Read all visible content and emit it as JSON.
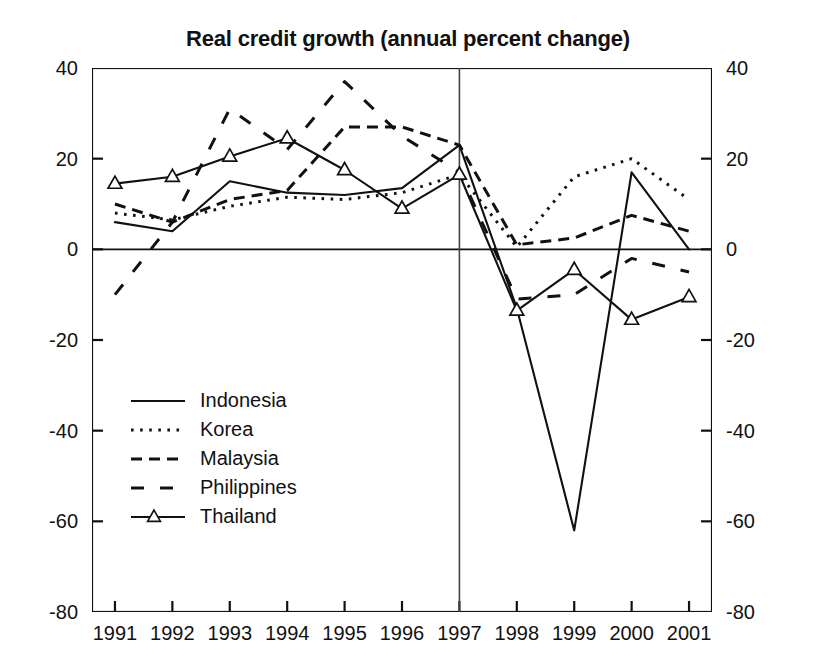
{
  "chart_data": {
    "type": "line",
    "title": "Real credit growth (annual percent change)",
    "xlabel": "",
    "ylabel": "",
    "x": [
      1991,
      1992,
      1993,
      1994,
      1995,
      1996,
      1997,
      1998,
      1999,
      2000,
      2001
    ],
    "xticklabels": [
      "1991",
      "1992",
      "1993",
      "1994",
      "1995",
      "1996",
      "1997",
      "1998",
      "1999",
      "2000",
      "2001"
    ],
    "yticks": [
      40,
      20,
      0,
      -20,
      -40,
      -60,
      -80
    ],
    "yticklabels_left": [
      "40",
      "20",
      "0",
      "-20",
      "-40",
      "-60",
      "-80"
    ],
    "yticklabels_right": [
      "40",
      "20",
      "0",
      "-20",
      "-40",
      "-60",
      "-80"
    ],
    "ylim": [
      -80,
      40
    ],
    "xlim": [
      1990.6,
      2001.4
    ],
    "grid": false,
    "legend_position": "center-left-inside",
    "zero_line": 0,
    "reference_line_x": 1997,
    "series": [
      {
        "name": "Indonesia",
        "style": "solid",
        "marker": "none",
        "values": [
          6,
          4,
          15,
          12.5,
          12,
          13.5,
          23,
          -13,
          -62,
          17,
          0
        ]
      },
      {
        "name": "Korea",
        "style": "dotted",
        "marker": "none",
        "values": [
          8,
          6.5,
          9.5,
          11.5,
          11,
          12.5,
          16.5,
          0.5,
          16,
          20,
          11
        ]
      },
      {
        "name": "Malaysia",
        "style": "dashed",
        "marker": "none",
        "values": [
          10,
          6,
          11,
          13,
          27,
          27,
          23,
          1,
          2.5,
          7.5,
          4
        ]
      },
      {
        "name": "Philippines",
        "style": "longdash",
        "marker": "none",
        "values": [
          -10,
          6,
          31,
          22,
          37,
          25,
          17,
          -11,
          -10,
          -2,
          -5
        ]
      },
      {
        "name": "Thailand",
        "style": "solid",
        "marker": "triangle",
        "values": [
          14.5,
          16,
          20.5,
          24.5,
          17.5,
          9,
          16.5,
          -13.5,
          -4.5,
          -15.5,
          -10.5
        ]
      }
    ]
  },
  "legend": {
    "entries": [
      {
        "label": "Indonesia"
      },
      {
        "label": "Korea"
      },
      {
        "label": "Malaysia"
      },
      {
        "label": "Philippines"
      },
      {
        "label": "Thailand"
      }
    ]
  }
}
